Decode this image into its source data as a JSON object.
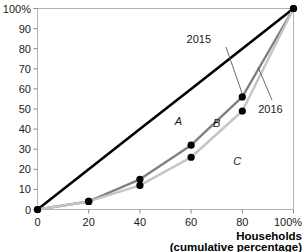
{
  "chart_data": {
    "type": "line",
    "title": "",
    "subtitle": "",
    "xlabel": "Households",
    "xlabel_sub": "(cumulative percentage)",
    "ylabel": "",
    "xlim": [
      0,
      100
    ],
    "ylim": [
      0,
      100
    ],
    "grid": false,
    "legend_position": "inline-annotations",
    "x": [
      0,
      20,
      40,
      60,
      80,
      100
    ],
    "xticks": [
      "0",
      "20",
      "40",
      "60",
      "80",
      "100%"
    ],
    "yticks": [
      "0",
      "10",
      "20",
      "30",
      "40",
      "50",
      "60",
      "70",
      "80",
      "90",
      "100%"
    ],
    "series": [
      {
        "name": "Line of equality",
        "values": [
          0,
          20,
          40,
          60,
          80,
          100
        ],
        "color": "#000000",
        "markers": false
      },
      {
        "name": "2015",
        "values": [
          0,
          4,
          15,
          32,
          56,
          100
        ],
        "color": "#808080",
        "markers": true
      },
      {
        "name": "2016",
        "values": [
          0,
          4,
          12,
          26,
          49,
          100
        ],
        "color": "#c4c4c4",
        "markers": true
      }
    ],
    "annotations": [
      {
        "text": "2015",
        "x": 63,
        "y": 83
      },
      {
        "text": "2016",
        "x": 91,
        "y": 48
      },
      {
        "text": "A",
        "x": 55,
        "y": 42
      },
      {
        "text": "B",
        "x": 70,
        "y": 41
      },
      {
        "text": "C",
        "x": 78,
        "y": 22
      }
    ]
  },
  "axis": {
    "y_top_label": "100%",
    "x_end_label": "100%",
    "origin_label": "0"
  },
  "colors": {
    "equality_line": "#000000",
    "series_2015": "#808080",
    "series_2016": "#c4c4c4",
    "frame": "#b4b4b4",
    "text": "#1a1a1a"
  }
}
